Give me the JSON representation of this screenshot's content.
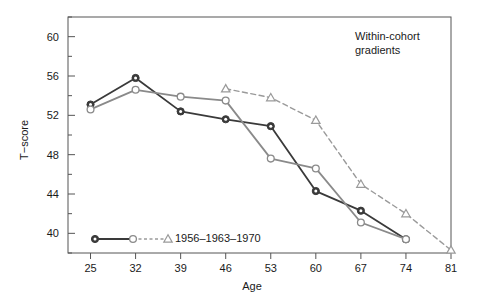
{
  "chart_data": {
    "type": "line",
    "title": "",
    "annotation": "Within-cohort\ngradients",
    "annotation_line1": "Within-cohort",
    "annotation_line2": "gradients",
    "xlabel": "Age",
    "ylabel": "T−score",
    "xlim": [
      21.5,
      81.0
    ],
    "ylim": [
      38.0,
      62.0
    ],
    "xticks": [
      25,
      32,
      39,
      46,
      53,
      60,
      67,
      74,
      81
    ],
    "xtick_labels": [
      "25",
      "32",
      "39",
      "46",
      "53",
      "60",
      "67",
      "74",
      "81"
    ],
    "yticks": [
      40,
      44,
      48,
      52,
      56,
      60
    ],
    "ytick_labels": [
      "40",
      "44",
      "48",
      "52",
      "56",
      "60"
    ],
    "yticks_minor": [
      38,
      42,
      46,
      50,
      54,
      58,
      62
    ],
    "grid": false,
    "legend_position": "bottom-left-inside",
    "legend_label": "1956–1963–1970",
    "series": [
      {
        "name": "1956",
        "color": "#3a3a3a",
        "line_style": "solid",
        "marker": "circle-filled",
        "x": [
          25,
          32,
          39,
          46,
          53,
          60,
          67,
          74
        ],
        "values": [
          53.1,
          55.8,
          52.4,
          51.6,
          50.9,
          44.3,
          42.3,
          39.4
        ]
      },
      {
        "name": "1963",
        "color": "#8a8a8a",
        "line_style": "solid",
        "marker": "circle-open",
        "x": [
          25,
          32,
          39,
          46,
          53,
          60,
          67,
          74
        ],
        "values": [
          52.6,
          54.6,
          53.9,
          53.5,
          47.6,
          46.6,
          41.1,
          39.4
        ]
      },
      {
        "name": "1970",
        "color": "#9a9a9a",
        "line_style": "dashed",
        "marker": "triangle-open",
        "x": [
          46,
          53,
          60,
          67,
          74,
          81
        ],
        "values": [
          54.7,
          53.8,
          51.5,
          45.0,
          42.0,
          38.3
        ]
      }
    ]
  }
}
